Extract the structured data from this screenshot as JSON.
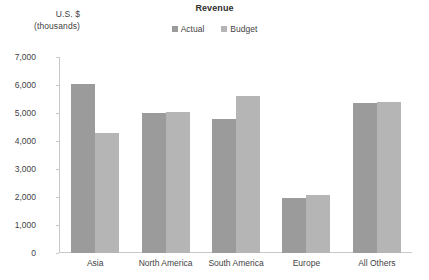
{
  "chart_data": {
    "type": "bar",
    "title": "Revenue",
    "xlabel": "",
    "ylabel": "U.S. $ (thousands)",
    "ylabel_line1": "U.S. $",
    "ylabel_line2": "(thousands)",
    "categories": [
      "Asia",
      "North America",
      "South America",
      "Europe",
      "All Others"
    ],
    "series": [
      {
        "name": "Actual",
        "color": "#9b9b9b",
        "values": [
          6050,
          4990,
          4800,
          1980,
          5350
        ]
      },
      {
        "name": "Budget",
        "color": "#b5b5b5",
        "values": [
          4300,
          5050,
          5600,
          2060,
          5400
        ]
      }
    ],
    "ylim": [
      0,
      7000
    ],
    "ytick_values": [
      0,
      1000,
      2000,
      3000,
      4000,
      5000,
      6000,
      7000
    ],
    "ytick_labels": [
      "0",
      "1,000",
      "2,000",
      "3,000",
      "4,000",
      "5,000",
      "6,000",
      "7,000"
    ],
    "grid": false,
    "legend_position": "top-center",
    "axis_color": "#c8c8c8"
  }
}
